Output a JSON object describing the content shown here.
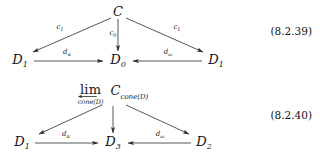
{
  "page": {
    "background": "#ffffff",
    "text_color": "#141414"
  },
  "equations": [
    {
      "id": "eq-8-2-39",
      "tag": "(8.2.39)",
      "apex": {
        "label": "C",
        "base": "C",
        "sub": ""
      },
      "nodes": [
        {
          "name": "left-object",
          "base": "D",
          "sub": "1"
        },
        {
          "name": "center-object",
          "base": "D",
          "sub": "0"
        },
        {
          "name": "right-object",
          "base": "D",
          "sub": "1"
        }
      ],
      "arrows": [
        {
          "name": "apex-to-left",
          "base": "c",
          "sub": "1"
        },
        {
          "name": "apex-to-center",
          "base": "c",
          "sub": "0"
        },
        {
          "name": "apex-to-right",
          "base": "c",
          "sub": "1"
        },
        {
          "name": "left-to-center",
          "base": "d",
          "sub": "α"
        },
        {
          "name": "right-to-center",
          "base": "d",
          "sub": "ω"
        }
      ]
    },
    {
      "id": "eq-8-2-40",
      "tag": "(8.2.40)",
      "apex": {
        "limit_word": "lim",
        "limit_subscript": "cone(D)",
        "object_base": "C",
        "object_sub": "cone(D)"
      },
      "nodes": [
        {
          "name": "left-object",
          "base": "D",
          "sub": "1"
        },
        {
          "name": "center-object",
          "base": "D",
          "sub": "3"
        },
        {
          "name": "right-object",
          "base": "D",
          "sub": "2"
        }
      ],
      "arrows": [
        {
          "name": "apex-to-left",
          "base": "",
          "sub": ""
        },
        {
          "name": "apex-to-center",
          "base": "",
          "sub": ""
        },
        {
          "name": "apex-to-right",
          "base": "",
          "sub": ""
        },
        {
          "name": "left-to-center",
          "base": "d",
          "sub": "α"
        },
        {
          "name": "right-to-center",
          "base": "d",
          "sub": "ω"
        }
      ]
    }
  ]
}
